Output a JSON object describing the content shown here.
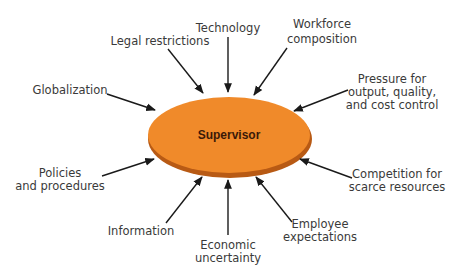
{
  "center": {
    "label": "Supervisor",
    "fill": "#f08a2a",
    "shadow": "#b85a14"
  },
  "arrow_color": "#1a1a1a",
  "text_color": "#3a3a3a",
  "factors": [
    {
      "id": "technology",
      "lines": [
        "Technology"
      ]
    },
    {
      "id": "legal",
      "lines": [
        "Legal restrictions"
      ]
    },
    {
      "id": "workforce",
      "lines": [
        "Workforce",
        "composition"
      ]
    },
    {
      "id": "globalization",
      "lines": [
        "Globalization"
      ]
    },
    {
      "id": "pressure",
      "lines": [
        "Pressure for",
        "output, quality,",
        "and cost control"
      ]
    },
    {
      "id": "policies",
      "lines": [
        "Policies",
        "and procedures"
      ]
    },
    {
      "id": "competition",
      "lines": [
        "Competition for",
        "scarce resources"
      ]
    },
    {
      "id": "information",
      "lines": [
        "Information"
      ]
    },
    {
      "id": "economic",
      "lines": [
        "Economic",
        "uncertainty"
      ]
    },
    {
      "id": "employee",
      "lines": [
        "Employee",
        "expectations"
      ]
    }
  ],
  "labels": {
    "technology": "Technology",
    "legal": "Legal restrictions",
    "workforce_1": "Workforce",
    "workforce_2": "composition",
    "globalization": "Globalization",
    "pressure_1": "Pressure for",
    "pressure_2": "output, quality,",
    "pressure_3": "and cost control",
    "policies_1": "Policies",
    "policies_2": "and procedures",
    "competition_1": "Competition for",
    "competition_2": "scarce resources",
    "information": "Information",
    "economic_1": "Economic",
    "economic_2": "uncertainty",
    "employee_1": "Employee",
    "employee_2": "expectations"
  }
}
